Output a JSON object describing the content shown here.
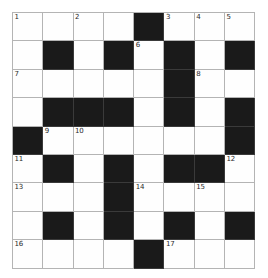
{
  "puzzle": {
    "kind": "crossword-grid",
    "columns": 8,
    "rows": 9,
    "colors": {
      "block": "#1a1a1a",
      "open": "#fefefe",
      "gridline": "#b4b4b4",
      "number_text": "#2a2a2a",
      "page_background": "#ffffff"
    },
    "clue_numbers_in_order": [
      1,
      2,
      3,
      4,
      5,
      6,
      7,
      8,
      9,
      10,
      11,
      12,
      13,
      14,
      15,
      16,
      17
    ],
    "legend": {
      "open_code": "open",
      "block_code": "block"
    },
    "cells": [
      [
        {
          "state": "open",
          "number": "1"
        },
        {
          "state": "open",
          "number": ""
        },
        {
          "state": "open",
          "number": "2"
        },
        {
          "state": "open",
          "number": ""
        },
        {
          "state": "block",
          "number": ""
        },
        {
          "state": "open",
          "number": "3"
        },
        {
          "state": "open",
          "number": "4"
        },
        {
          "state": "open",
          "number": "5"
        }
      ],
      [
        {
          "state": "open",
          "number": ""
        },
        {
          "state": "block",
          "number": ""
        },
        {
          "state": "open",
          "number": ""
        },
        {
          "state": "block",
          "number": ""
        },
        {
          "state": "open",
          "number": "6"
        },
        {
          "state": "block",
          "number": ""
        },
        {
          "state": "open",
          "number": ""
        },
        {
          "state": "block",
          "number": ""
        }
      ],
      [
        {
          "state": "open",
          "number": "7"
        },
        {
          "state": "open",
          "number": ""
        },
        {
          "state": "open",
          "number": ""
        },
        {
          "state": "open",
          "number": ""
        },
        {
          "state": "open",
          "number": ""
        },
        {
          "state": "block",
          "number": ""
        },
        {
          "state": "open",
          "number": "8"
        },
        {
          "state": "open",
          "number": ""
        }
      ],
      [
        {
          "state": "open",
          "number": ""
        },
        {
          "state": "block",
          "number": ""
        },
        {
          "state": "block",
          "number": ""
        },
        {
          "state": "block",
          "number": ""
        },
        {
          "state": "open",
          "number": ""
        },
        {
          "state": "block",
          "number": ""
        },
        {
          "state": "open",
          "number": ""
        },
        {
          "state": "block",
          "number": ""
        }
      ],
      [
        {
          "state": "block",
          "number": ""
        },
        {
          "state": "open",
          "number": "9"
        },
        {
          "state": "open",
          "number": "10"
        },
        {
          "state": "open",
          "number": ""
        },
        {
          "state": "open",
          "number": ""
        },
        {
          "state": "open",
          "number": ""
        },
        {
          "state": "open",
          "number": ""
        },
        {
          "state": "block",
          "number": ""
        }
      ],
      [
        {
          "state": "open",
          "number": "11"
        },
        {
          "state": "block",
          "number": ""
        },
        {
          "state": "open",
          "number": ""
        },
        {
          "state": "block",
          "number": ""
        },
        {
          "state": "open",
          "number": ""
        },
        {
          "state": "block",
          "number": ""
        },
        {
          "state": "block",
          "number": ""
        },
        {
          "state": "open",
          "number": "12"
        }
      ],
      [
        {
          "state": "open",
          "number": "13"
        },
        {
          "state": "open",
          "number": ""
        },
        {
          "state": "open",
          "number": ""
        },
        {
          "state": "block",
          "number": ""
        },
        {
          "state": "open",
          "number": "14"
        },
        {
          "state": "open",
          "number": ""
        },
        {
          "state": "open",
          "number": "15"
        },
        {
          "state": "open",
          "number": ""
        }
      ],
      [
        {
          "state": "open",
          "number": ""
        },
        {
          "state": "block",
          "number": ""
        },
        {
          "state": "open",
          "number": ""
        },
        {
          "state": "block",
          "number": ""
        },
        {
          "state": "open",
          "number": ""
        },
        {
          "state": "block",
          "number": ""
        },
        {
          "state": "open",
          "number": ""
        },
        {
          "state": "block",
          "number": ""
        }
      ],
      [
        {
          "state": "open",
          "number": "16"
        },
        {
          "state": "open",
          "number": ""
        },
        {
          "state": "open",
          "number": ""
        },
        {
          "state": "open",
          "number": ""
        },
        {
          "state": "block",
          "number": ""
        },
        {
          "state": "open",
          "number": "17"
        },
        {
          "state": "open",
          "number": ""
        },
        {
          "state": "open",
          "number": ""
        }
      ]
    ]
  }
}
